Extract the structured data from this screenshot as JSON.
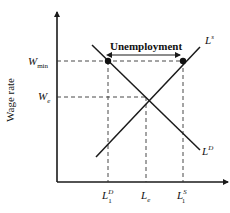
{
  "diagram": {
    "y_axis_label": "Wage rate",
    "wage_levels": {
      "w_min": {
        "base": "W",
        "sub": "min"
      },
      "w_e": {
        "base": "W",
        "sub": "e"
      }
    },
    "quantity_levels": {
      "l1d": {
        "base": "L",
        "sub": "1",
        "sup": "D"
      },
      "le": {
        "base": "L",
        "sub": "e"
      },
      "l1s": {
        "base": "L",
        "sub": "1",
        "sup": "S"
      }
    },
    "curves": {
      "supply": {
        "base": "L",
        "sup": "s"
      },
      "demand": {
        "base": "L",
        "sup": "D"
      }
    },
    "gap_label": "Unemployment",
    "colors": {
      "line": "#1a1a1a",
      "dashed": "#333333",
      "background": "#ffffff"
    }
  }
}
